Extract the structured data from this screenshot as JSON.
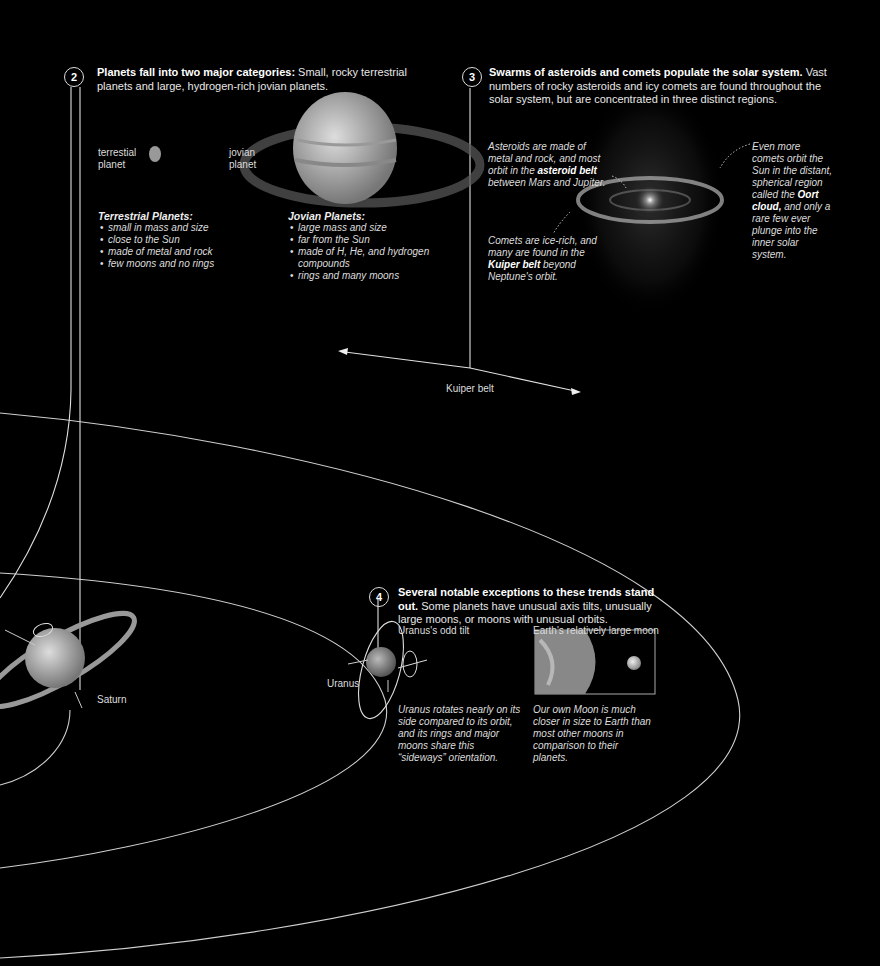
{
  "section2": {
    "number": "2",
    "heading_bold": "Planets fall into two major categories:",
    "heading_rest": " Small, rocky terrestrial planets and large, hydrogen-rich jovian planets.",
    "terrestrial_label_1": "terrestial",
    "terrestrial_label_2": "planet",
    "jovian_label_1": "jovian",
    "jovian_label_2": "planet",
    "terrestrial_list": {
      "title": "Terrestrial Planets:",
      "items": [
        "small in mass and size",
        "close to the Sun",
        "made of metal and rock",
        "few moons and no rings"
      ]
    },
    "jovian_list": {
      "title": "Jovian Planets:",
      "items": [
        "large mass and size",
        "far from the Sun",
        "made of H, He, and hydrogen compounds",
        "rings and many moons"
      ]
    }
  },
  "section3": {
    "number": "3",
    "heading_bold": "Swarms of asteroids and comets populate the solar system.",
    "heading_rest": " Vast numbers of rocky asteroids and icy comets are found throughout the solar system, but are concentrated in three distinct regions.",
    "asteroids_pre": "Asteroids are made of metal and rock, and most orbit in the ",
    "asteroids_bold": "asteroid belt",
    "asteroids_post": " between Mars and Jupiter.",
    "comets_pre": "Comets are ice-rich, and many are found in the ",
    "comets_bold": "Kuiper belt",
    "comets_post": " beyond Neptune's orbit.",
    "oort_pre": "Even more comets orbit the Sun in the distant, spherical region called the ",
    "oort_bold": "Oort cloud,",
    "oort_post": " and only a rare few ever plunge into the inner solar system.",
    "kuiper_label": "Kuiper belt"
  },
  "section4": {
    "number": "4",
    "heading_bold": "Several notable exceptions to these trends stand out.",
    "heading_rest": " Some planets have unusual axis tilts, unusually large moons, or moons with unusual orbits.",
    "uranus_title": "Uranus's odd tilt",
    "earth_title": "Earth's relatively large moon",
    "uranus_caption": "Uranus rotates nearly on its side compared to its orbit, and its rings and major moons share this “sideways” orientation.",
    "earth_caption": "Our own Moon is much closer in size to Earth than most other moons in comparison to their planets."
  },
  "planets": {
    "saturn": "Saturn",
    "uranus": "Uranus"
  }
}
